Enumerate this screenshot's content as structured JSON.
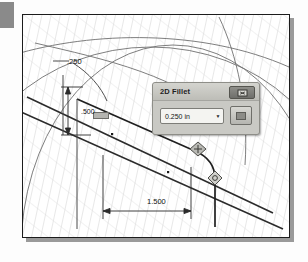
{
  "app": {
    "kind": "cad-sketch-view",
    "background_color": "#fdfdfd"
  },
  "canvas": {
    "name": "cad-drawing-canvas",
    "frame_border_color": "#1c1c1c",
    "shadow_color": "#9a9a9a",
    "hatch_color": "#c4c4c4",
    "geometry_color": "#2a2a2a",
    "construction_color": "#6b6b6b"
  },
  "dimensions": [
    {
      "id": "fillet-radius",
      "label": ".250"
    },
    {
      "id": "vertical-offset",
      "label": ".500"
    },
    {
      "id": "horizontal-length",
      "label": "1.500"
    }
  ],
  "dialog": {
    "title": "2D Fillet",
    "close_icon": "close-icon",
    "input": {
      "value": "0.250 in",
      "placeholder": "0.250 in",
      "dropdown_icon": "chevron-down-icon"
    },
    "ok_button": {
      "label": "",
      "icon": "apply-icon"
    },
    "accent_color": "#c9c9c4"
  },
  "glyphs": [
    {
      "id": "constraint-tangent",
      "name": "constraint-glyph"
    },
    {
      "id": "constraint-coincident",
      "name": "constraint-glyph"
    }
  ]
}
